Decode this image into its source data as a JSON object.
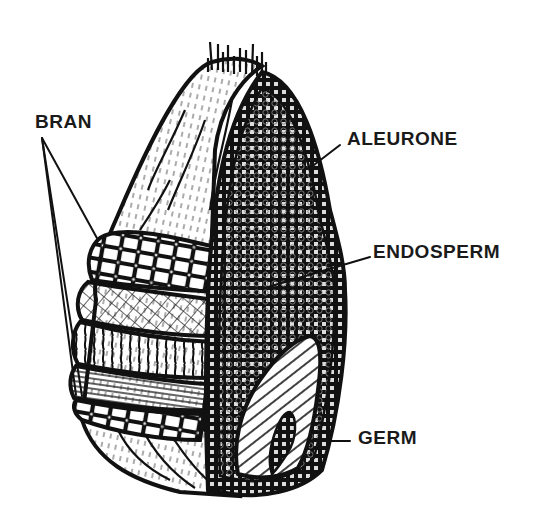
{
  "diagram": {
    "labels": {
      "bran": "BRAN",
      "aleurone": "ALEURONE",
      "endosperm": "ENDOSPERM",
      "germ": "GERM"
    },
    "colors": {
      "ink": "#111111",
      "background": "#ffffff",
      "label_text": "#1a1a1a",
      "endosperm_dot": "#777777"
    }
  }
}
